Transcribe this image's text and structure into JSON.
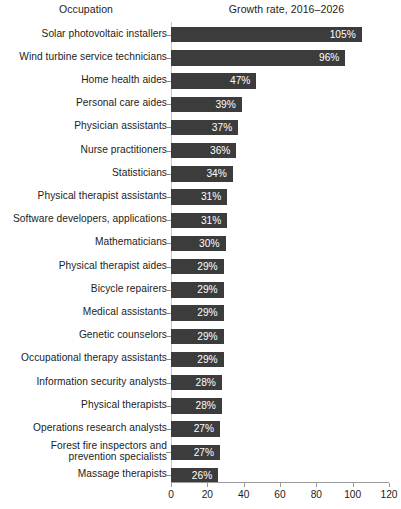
{
  "headers": {
    "occupation": "Occupation",
    "growth": "Growth rate, 2016–2026"
  },
  "chart_data": {
    "type": "bar",
    "orientation": "horizontal",
    "title": "",
    "xlabel": "",
    "ylabel": "",
    "xlim": [
      0,
      120
    ],
    "xticks": [
      0,
      20,
      40,
      60,
      80,
      100,
      120
    ],
    "grid": false,
    "legend": null,
    "bar_color": "#3c3c3c",
    "value_label_color": "#ffffff",
    "axis_color": "#9a9a9a",
    "categories": [
      "Solar photovoltaic installers",
      "Wind turbine service technicians",
      "Home health aides",
      "Personal care aides",
      "Physician assistants",
      "Nurse practitioners",
      "Statisticians",
      "Physical therapist assistants",
      "Software developers, applications",
      "Mathematicians",
      "Physical therapist aides",
      "Bicycle repairers",
      "Medical assistants",
      "Genetic counselors",
      "Occupational therapy assistants",
      "Information security analysts",
      "Physical therapists",
      "Operations research analysts",
      "Forest fire inspectors and prevention specialists",
      "Massage therapists"
    ],
    "values": [
      105,
      96,
      47,
      39,
      37,
      36,
      34,
      31,
      31,
      30,
      29,
      29,
      29,
      29,
      29,
      28,
      28,
      27,
      27,
      26
    ],
    "value_labels": [
      "105%",
      "96%",
      "47%",
      "39%",
      "37%",
      "36%",
      "34%",
      "31%",
      "31%",
      "30%",
      "29%",
      "29%",
      "29%",
      "29%",
      "29%",
      "28%",
      "28%",
      "27%",
      "27%",
      "26%"
    ],
    "category_lines": [
      [
        "Solar photovoltaic installers"
      ],
      [
        "Wind turbine service technicians"
      ],
      [
        "Home health aides"
      ],
      [
        "Personal care aides"
      ],
      [
        "Physician assistants"
      ],
      [
        "Nurse practitioners"
      ],
      [
        "Statisticians"
      ],
      [
        "Physical therapist assistants"
      ],
      [
        "Software developers, applications"
      ],
      [
        "Mathematicians"
      ],
      [
        "Physical therapist aides"
      ],
      [
        "Bicycle repairers"
      ],
      [
        "Medical assistants"
      ],
      [
        "Genetic counselors"
      ],
      [
        "Occupational therapy assistants"
      ],
      [
        "Information security analysts"
      ],
      [
        "Physical therapists"
      ],
      [
        "Operations research analysts"
      ],
      [
        "Forest fire inspectors and",
        "prevention specialists"
      ],
      [
        "Massage therapists"
      ]
    ]
  }
}
